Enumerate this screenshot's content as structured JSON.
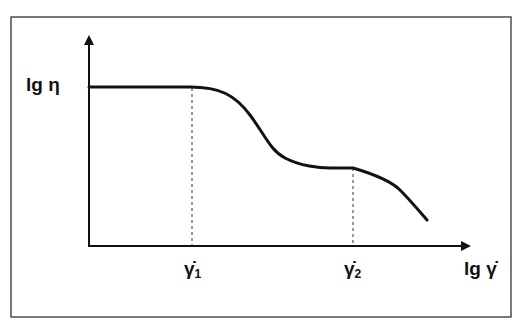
{
  "diagram": {
    "y_axis_label": "lg η",
    "x_axis_label": "lg γ̇",
    "markers": [
      {
        "symbol": "γ̇",
        "subscript": "1"
      },
      {
        "symbol": "γ̇",
        "subscript": "2"
      }
    ],
    "colors": {
      "line": "#111111",
      "frame": "#333333",
      "background": "#ffffff"
    }
  }
}
